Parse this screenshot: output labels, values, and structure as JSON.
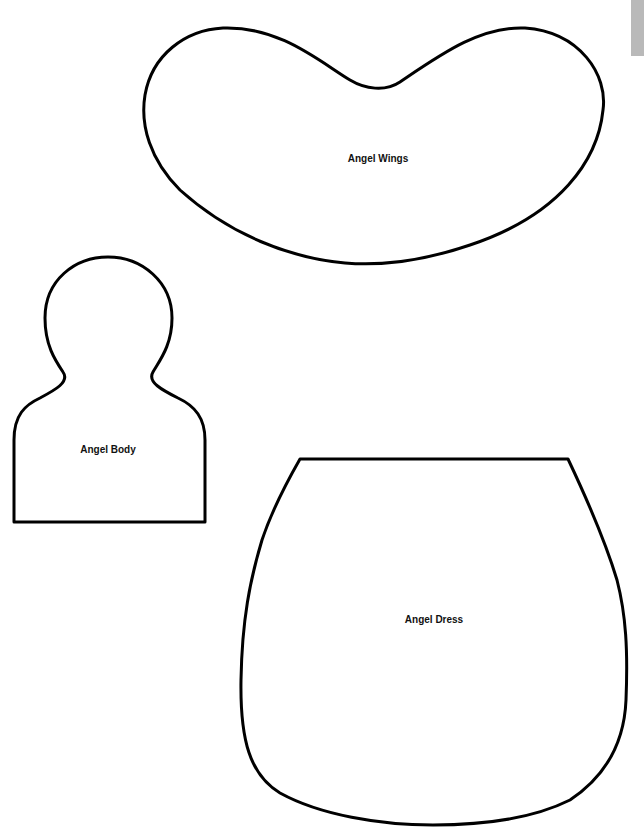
{
  "page": {
    "background": "#ffffff",
    "stroke_color": "#000000"
  },
  "pieces": [
    {
      "id": "wings",
      "label": "Angel Wings",
      "label_x": 378,
      "label_y": 158
    },
    {
      "id": "body",
      "label": "Angel Body",
      "label_x": 108,
      "label_y": 449
    },
    {
      "id": "dress",
      "label": "Angel Dress",
      "label_x": 434,
      "label_y": 619
    }
  ],
  "edge_tab": {
    "color": "#b9b9b9"
  }
}
